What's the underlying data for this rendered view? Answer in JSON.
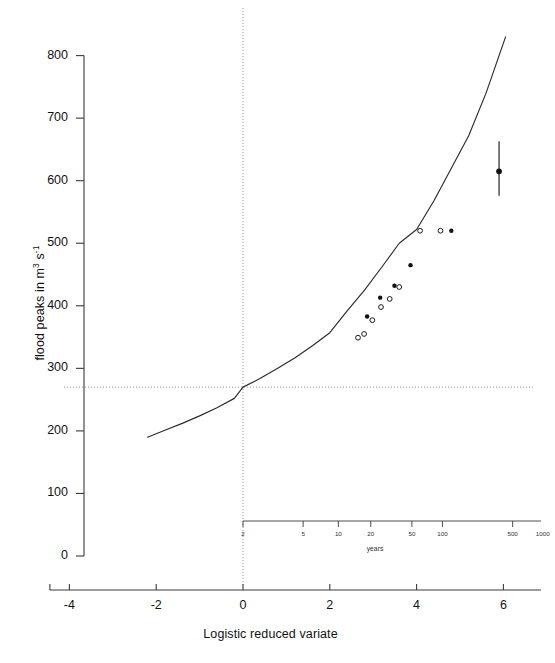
{
  "figure": {
    "name": "flood-frequency-plot",
    "background": "#ffffff",
    "width": 541,
    "height": 663
  },
  "axes": {
    "y": {
      "title_plain": "flood peaks in m3 s-1",
      "title_prefix": "flood peaks in m",
      "title_sup1": "3",
      "title_mid": " s",
      "title_sup2": "-1",
      "ticks": [
        0,
        100,
        200,
        300,
        400,
        500,
        600,
        700,
        800
      ],
      "min": 0,
      "max": 840,
      "tick_labels": [
        "0",
        "100",
        "200",
        "300",
        "400",
        "500",
        "600",
        "700",
        "800"
      ]
    },
    "x": {
      "title": "Logistic reduced variate",
      "ticks": [
        -4,
        -2,
        0,
        2,
        4,
        6
      ],
      "tick_labels": [
        "-4",
        "-2",
        "0",
        "2",
        "4",
        "6"
      ],
      "min": -4.45,
      "max": 7.0
    },
    "secondary": {
      "title": "years",
      "tick_labels": [
        "2",
        "5",
        "10",
        "20",
        "50",
        "100",
        "500",
        "1000"
      ],
      "tick_values": [
        2,
        5,
        10,
        20,
        50,
        100,
        500,
        1000
      ]
    }
  },
  "reference_lines": {
    "vertical_at_x": 0,
    "horizontal_at_y": 270,
    "style": "dotted",
    "color": "#7a7a7a"
  },
  "chart_data": {
    "type": "scatter",
    "title": "",
    "xlabel": "Logistic reduced variate",
    "ylabel": "flood peaks in m3 s-1",
    "xlim": [
      -4.45,
      7.0
    ],
    "ylim": [
      0,
      840
    ],
    "grid": false,
    "legend": "none",
    "secondary_xaxis": {
      "label": "years",
      "ticks": [
        2,
        5,
        10,
        20,
        50,
        100,
        500,
        1000
      ]
    },
    "annotations": [
      {
        "name": "vertical-reference",
        "type": "vline",
        "x": 0,
        "style": "dotted"
      },
      {
        "name": "horizontal-reference",
        "type": "hline",
        "y": 270,
        "style": "dotted"
      }
    ],
    "series": [
      {
        "name": "fitted logistic curve",
        "type": "line",
        "color": "#2b2b2b",
        "x": [
          -2.2,
          -1.8,
          -1.4,
          -1.0,
          -0.6,
          -0.2,
          0.0,
          0.4,
          0.8,
          1.2,
          1.6,
          2.0,
          2.4,
          2.8,
          3.2,
          3.6,
          4.0,
          4.4,
          4.8,
          5.2,
          5.6,
          6.05
        ],
        "y": [
          190,
          201,
          212,
          224,
          237,
          252,
          270,
          284,
          300,
          317,
          336,
          357,
          392,
          425,
          462,
          500,
          522,
          568,
          620,
          672,
          740,
          830
        ]
      },
      {
        "name": "observed peaks (filled)",
        "type": "scatter",
        "marker": "filled-circle",
        "color": "#111111",
        "x": [
          2.86,
          3.16,
          3.49,
          3.86,
          4.8
        ],
        "y": [
          383,
          413,
          432,
          465,
          520
        ]
      },
      {
        "name": "observed peaks (open)",
        "type": "scatter",
        "marker": "open-circle",
        "color": "#111111",
        "x": [
          2.65,
          2.79,
          2.98,
          3.18,
          3.38,
          3.6,
          4.08,
          4.55
        ],
        "y": [
          349,
          355,
          377,
          398,
          411,
          430,
          520,
          520
        ]
      },
      {
        "name": "design estimate with uncertainty",
        "type": "scatter-errorbar",
        "marker": "filled-circle",
        "color": "#111111",
        "x": [
          5.9
        ],
        "y": [
          615
        ],
        "yerr_low": [
          576
        ],
        "yerr_high": [
          663
        ]
      }
    ]
  }
}
